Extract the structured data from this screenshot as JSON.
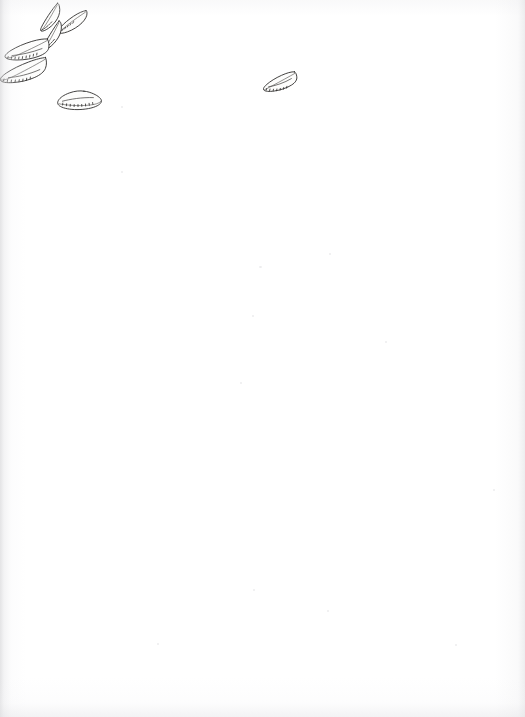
{
  "document": {
    "kind": "scanned-page",
    "title": "Specimen drawing plate",
    "page_width": 525,
    "page_height": 717,
    "paper_color": "#ffffff",
    "ink_color": "#2e2c2b",
    "body_text": "",
    "visible_text": "",
    "caption": "",
    "page_number": ""
  },
  "plate": {
    "name": "specimen-outline-plate",
    "description": "Seven hand-drawn pen-and-ink outlines of elongated leaf-shaped specimens",
    "specimen_count": 7,
    "ink_color": "#2e2c2b",
    "fill_color": "#fdfdfc",
    "clusters": [
      {
        "name": "upper-left-cluster",
        "specimen_count": 6,
        "bounds": {
          "x": 0,
          "y": 0,
          "width": 105,
          "height": 120
        }
      },
      {
        "name": "upper-center-isolate",
        "specimen_count": 1,
        "bounds": {
          "x": 262,
          "y": 68,
          "width": 36,
          "height": 26
        }
      }
    ],
    "specimens": [
      {
        "id": "specimen-1",
        "label": "",
        "position": {
          "x": 38,
          "y": 2
        },
        "size": {
          "width": 22,
          "height": 30
        },
        "orientation": "tilted-left",
        "form": "narrow-lanceolate",
        "has_serration": true
      },
      {
        "id": "specimen-2",
        "label": "",
        "position": {
          "x": 57,
          "y": 9
        },
        "size": {
          "width": 30,
          "height": 26
        },
        "orientation": "tilted-right",
        "form": "narrow-lanceolate",
        "has_serration": true
      },
      {
        "id": "specimen-3",
        "label": "",
        "position": {
          "x": 40,
          "y": 20
        },
        "size": {
          "width": 22,
          "height": 30
        },
        "orientation": "tilted-left",
        "form": "narrow-lanceolate",
        "has_serration": true
      },
      {
        "id": "specimen-4",
        "label": "",
        "position": {
          "x": 4,
          "y": 38
        },
        "size": {
          "width": 44,
          "height": 24
        },
        "orientation": "horizontal",
        "form": "broad-ovate",
        "has_serration": true
      },
      {
        "id": "specimen-5",
        "label": "",
        "position": {
          "x": 0,
          "y": 57
        },
        "size": {
          "width": 46,
          "height": 28
        },
        "orientation": "horizontal",
        "form": "broad-ovate",
        "has_serration": true
      },
      {
        "id": "specimen-6",
        "label": "",
        "position": {
          "x": 57,
          "y": 90
        },
        "size": {
          "width": 45,
          "height": 22
        },
        "orientation": "horizontal",
        "form": "broad-ovate",
        "has_serration": true
      },
      {
        "id": "specimen-7",
        "label": "",
        "position": {
          "x": 263,
          "y": 71
        },
        "size": {
          "width": 34,
          "height": 22
        },
        "orientation": "horizontal",
        "form": "broad-ovate",
        "has_serration": true
      }
    ]
  }
}
